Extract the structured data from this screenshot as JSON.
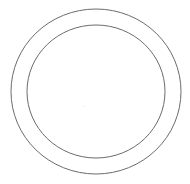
{
  "diagram": {
    "type": "concentric-circles",
    "stroke_color": "#6b6b6b",
    "background": "#ffffff",
    "shapes": [
      {
        "name": "outer-circle",
        "cx": 96,
        "cy": 91.5,
        "rx": 85,
        "ry": 82.5
      },
      {
        "name": "inner-circle",
        "cx": 96,
        "cy": 91.5,
        "rx": 69,
        "ry": 66.5
      }
    ]
  }
}
